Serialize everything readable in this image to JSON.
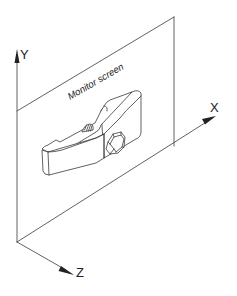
{
  "diagram": {
    "screen_label": "Monitor screen",
    "axes": {
      "x_label": "X",
      "y_label": "Y",
      "z_label": "Z"
    },
    "colors": {
      "line": "#3a3a3a",
      "background": "#ffffff"
    }
  }
}
